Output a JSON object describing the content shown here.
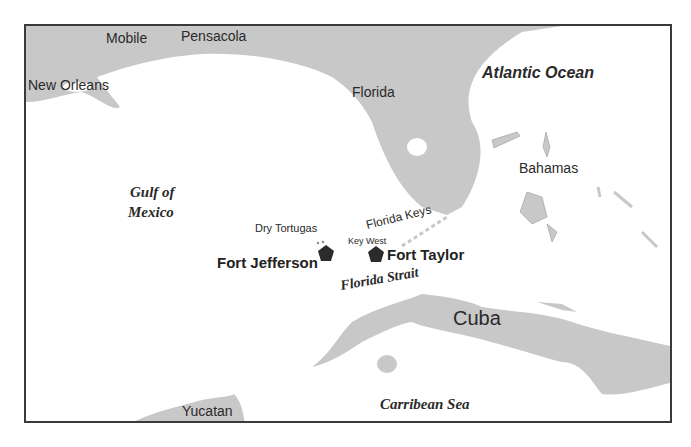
{
  "map": {
    "colors": {
      "land": "#c8c8c8",
      "water": "#ffffff",
      "border": "#3a3a3a",
      "fort_marker": "#2b2b2b",
      "text": "#2a2a2a"
    },
    "labels": {
      "mobile": "Mobile",
      "pensacola": "Pensacola",
      "new_orleans": "New Orleans",
      "florida": "Florida",
      "atlantic": "Atlantic Ocean",
      "bahamas": "Bahamas",
      "gulf_line1": "Gulf of",
      "gulf_line2": "Mexico",
      "dry_tortugas": "Dry Tortugas",
      "florida_keys": "Florida Keys",
      "key_west": "Key West",
      "fort_jefferson": "Fort Jefferson",
      "fort_taylor": "Fort Taylor",
      "florida_strait": "Florida Strait",
      "cuba": "Cuba",
      "yucatan": "Yucatan",
      "caribbean": "Carribean Sea"
    },
    "markers": [
      {
        "name": "Fort Jefferson",
        "icon": "pentagon-icon"
      },
      {
        "name": "Fort Taylor",
        "icon": "pentagon-icon"
      }
    ]
  }
}
